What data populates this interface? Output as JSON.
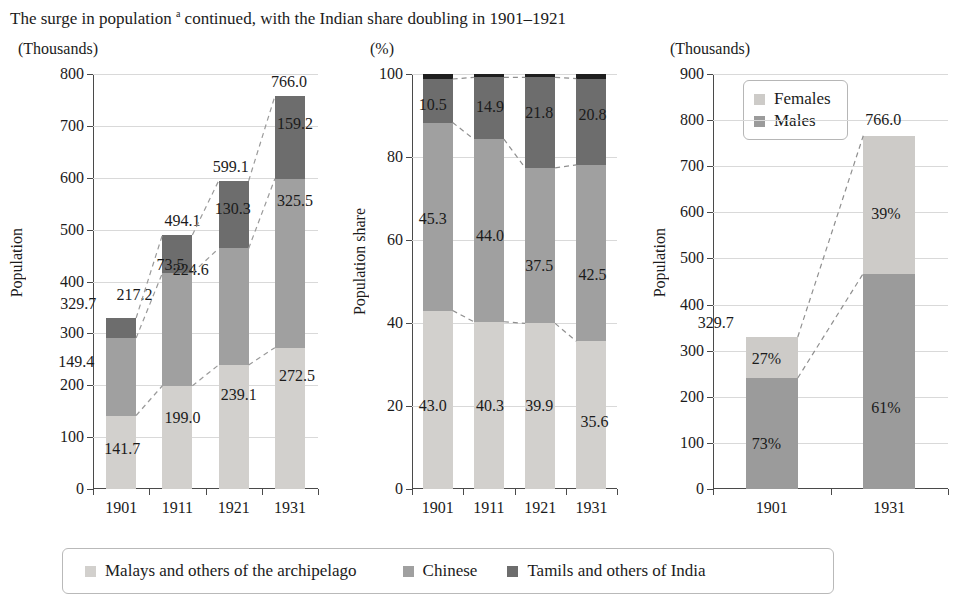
{
  "title": {
    "text_before": "The surge in population",
    "footnote_marker": "a",
    "text_after": "continued, with the Indian share doubling in 1901–1921"
  },
  "colors": {
    "malays": "#d2d0cd",
    "chinese": "#a0a0a0",
    "tamils": "#6d6d6d",
    "other": "#1f1f1f",
    "females": "#cdcbc8",
    "males": "#9b9b9b",
    "grid": "#d9d9d9",
    "axis": "#4a4a4a",
    "text": "#1b1b1b"
  },
  "legend": {
    "items": [
      {
        "label": "Malays and others of the archipelago",
        "color": "#d2d0cd"
      },
      {
        "label": "Chinese",
        "color": "#a0a0a0"
      },
      {
        "label": "Tamils and others of India",
        "color": "#6d6d6d"
      }
    ]
  },
  "panels": {
    "left": {
      "unit": "(Thousands)",
      "axis_title": "Population",
      "yticks": [
        "0",
        "100",
        "200",
        "300",
        "400",
        "500",
        "600",
        "700",
        "800"
      ],
      "xticks": [
        "1901",
        "1911",
        "1921",
        "1931"
      ],
      "totals": [
        "329.7",
        "494.1",
        "599.1",
        "766.0"
      ],
      "malays": [
        "141.7",
        "199.0",
        "239.1",
        "272.5"
      ],
      "chinese": [
        "149.4",
        "217.2",
        "224.6",
        "325.5"
      ],
      "tamils": [
        "38.6",
        "73.5",
        "130.3",
        "159.2"
      ],
      "tamils_labels": [
        "",
        "73.5",
        "130.3",
        "159.2"
      ]
    },
    "mid": {
      "unit": "(%)",
      "axis_title": "Population share",
      "yticks": [
        "0",
        "20",
        "40",
        "60",
        "80",
        "100"
      ],
      "xticks": [
        "1901",
        "1911",
        "1921",
        "1931"
      ],
      "malays": [
        "43.0",
        "40.3",
        "39.9",
        "35.6"
      ],
      "chinese": [
        "45.3",
        "44.0",
        "37.5",
        "42.5"
      ],
      "tamils": [
        "10.5",
        "14.9",
        "21.8",
        "20.8"
      ],
      "other": [
        "1.2",
        "0.8",
        "0.8",
        "1.1"
      ]
    },
    "right": {
      "unit": "(Thousands)",
      "axis_title": "Population",
      "yticks": [
        "0",
        "100",
        "200",
        "300",
        "400",
        "500",
        "600",
        "700",
        "800",
        "900"
      ],
      "xticks": [
        "1901",
        "1931"
      ],
      "legend_items": [
        {
          "label": "Females",
          "color": "#cdcbc8"
        },
        {
          "label": "Males",
          "color": "#9b9b9b"
        }
      ],
      "totals": [
        "329.7",
        "766.0"
      ],
      "males_pct": [
        "73%",
        "61%"
      ],
      "females_pct": [
        "27%",
        "39%"
      ]
    }
  },
  "chart_data": {
    "type": "bar",
    "title": "The surge in population a continued, with the Indian share doubling in 1901–1921",
    "charts": [
      {
        "type": "bar",
        "subtype": "stacked",
        "unit": "(Thousands)",
        "ylabel": "Population",
        "xlabel": "",
        "ylim": [
          0,
          800
        ],
        "ytick_step": 100,
        "grid": true,
        "categories": [
          "1901",
          "1911",
          "1921",
          "1931"
        ],
        "series": [
          {
            "name": "Malays and others of the archipelago",
            "values": [
              141.7,
              199.0,
              239.1,
              272.5
            ]
          },
          {
            "name": "Chinese",
            "values": [
              149.4,
              217.2,
              224.6,
              325.5
            ]
          },
          {
            "name": "Tamils and others of India",
            "values": [
              38.6,
              73.5,
              130.3,
              159.2
            ]
          }
        ],
        "totals": [
          329.7,
          494.1,
          599.1,
          766.0
        ],
        "connectors": "dashed lines joining segment boundaries and bar tops across years"
      },
      {
        "type": "bar",
        "subtype": "stacked-100",
        "unit": "(%)",
        "ylabel": "Population share",
        "xlabel": "",
        "ylim": [
          0,
          100
        ],
        "ytick_step": 20,
        "grid": true,
        "categories": [
          "1901",
          "1911",
          "1921",
          "1931"
        ],
        "series": [
          {
            "name": "Malays and others of the archipelago",
            "values": [
              43.0,
              40.3,
              39.9,
              35.6
            ]
          },
          {
            "name": "Chinese",
            "values": [
              45.3,
              44.0,
              37.5,
              42.5
            ]
          },
          {
            "name": "Tamils and others of India",
            "values": [
              10.5,
              14.9,
              21.8,
              20.8
            ]
          },
          {
            "name": "Others",
            "values": [
              1.2,
              0.8,
              0.8,
              1.1
            ]
          }
        ],
        "connectors": "dashed lines joining segment boundaries across years"
      },
      {
        "type": "bar",
        "subtype": "stacked",
        "unit": "(Thousands)",
        "ylabel": "Population",
        "xlabel": "",
        "ylim": [
          0,
          900
        ],
        "ytick_step": 100,
        "grid": true,
        "categories": [
          "1901",
          "1931"
        ],
        "series": [
          {
            "name": "Males",
            "values": [
              240.7,
              467.3
            ],
            "labels": [
              "73%",
              "61%"
            ]
          },
          {
            "name": "Females",
            "values": [
              89.0,
              298.7
            ],
            "labels": [
              "27%",
              "39%"
            ]
          }
        ],
        "totals": [
          329.7,
          766.0
        ],
        "legend_position": "inside top-left",
        "connectors": "dashed lines joining male/female boundary and bar tops"
      }
    ]
  }
}
